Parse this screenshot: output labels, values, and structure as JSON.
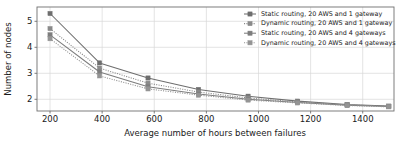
{
  "chart_data": {
    "type": "line",
    "title": "",
    "xlabel": "Average number of hours between failures",
    "ylabel": "Number of nodes",
    "xlim": [
      150,
      1520
    ],
    "ylim": [
      1.55,
      5.55
    ],
    "xticks": [
      200,
      400,
      600,
      800,
      1000,
      1200,
      1400
    ],
    "yticks": [
      2,
      3,
      4,
      5
    ],
    "grid": true,
    "legend_position": "upper right",
    "marker": "square",
    "x": [
      200,
      390,
      576,
      770,
      960,
      1150,
      1340,
      1500
    ],
    "series": [
      {
        "name": "Static routing, 20 AWS and 1 gateway",
        "linestyle": "solid",
        "color": "#6e6e6e",
        "values": [
          5.3,
          3.4,
          2.82,
          2.38,
          2.12,
          1.93,
          1.8,
          1.74
        ]
      },
      {
        "name": "Dynamic routing, 20 AWS and 1 gateway",
        "linestyle": "dotted",
        "color": "#8a8a8a",
        "values": [
          4.72,
          3.2,
          2.62,
          2.28,
          2.05,
          1.9,
          1.79,
          1.73
        ]
      },
      {
        "name": "Static routing, 20 AWS and 4 gateways",
        "linestyle": "solid",
        "color": "#7d7d7d",
        "values": [
          4.48,
          3.05,
          2.48,
          2.2,
          2.0,
          1.88,
          1.77,
          1.72
        ]
      },
      {
        "name": "Dynamic routing, 20 AWS and 4 gateways",
        "linestyle": "dotted",
        "color": "#949494",
        "values": [
          4.33,
          2.9,
          2.4,
          2.16,
          1.97,
          1.86,
          1.76,
          1.71
        ]
      }
    ]
  },
  "axis": {
    "xtick_labels": [
      "200",
      "400",
      "600",
      "800",
      "1000",
      "1200",
      "1400"
    ],
    "ytick_labels": [
      "2",
      "3",
      "4",
      "5"
    ]
  },
  "colors": {
    "grid": "#d9d9d9",
    "frame": "#6f6f6f",
    "text": "#1a1a1a",
    "background": "#ffffff"
  }
}
